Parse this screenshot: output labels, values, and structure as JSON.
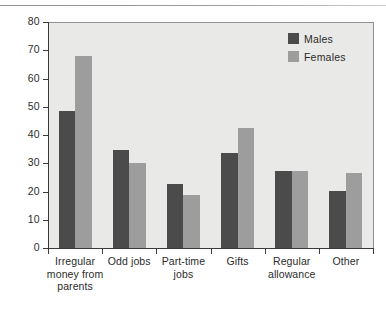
{
  "chart_data": {
    "type": "bar",
    "title": "",
    "subtitle": "",
    "xlabel": "",
    "ylabel": "",
    "ylim": [
      0,
      80
    ],
    "ytick_step": 10,
    "yticks": [
      "0",
      "10",
      "20",
      "30",
      "40",
      "50",
      "60",
      "70",
      "80"
    ],
    "grid": false,
    "legend_position": "top-right",
    "categories": [
      "Irregular money from parents",
      "Odd jobs",
      "Part-time jobs",
      "Gifts",
      "Regular allowance",
      "Other"
    ],
    "category_label_lines": [
      [
        "Irregular",
        "money from",
        "parents"
      ],
      [
        "Odd jobs"
      ],
      [
        "Part-time",
        "jobs"
      ],
      [
        "Gifts"
      ],
      [
        "Regular",
        "allowance"
      ],
      [
        "Other"
      ]
    ],
    "series": [
      {
        "name": "Males",
        "color": "#4b4b4b",
        "values": [
          49,
          35,
          23,
          34,
          27.5,
          20.5
        ]
      },
      {
        "name": "Females",
        "color": "#9d9d9d",
        "values": [
          68.5,
          30.5,
          19,
          43,
          27.5,
          27
        ]
      }
    ]
  },
  "legend": {
    "items": [
      {
        "label": "Males",
        "swatch": "males"
      },
      {
        "label": "Females",
        "swatch": "females"
      }
    ]
  },
  "colors": {
    "males": "#4b4b4b",
    "females": "#9d9d9d",
    "plot_background": "#e9e9e7",
    "axis": "#3b3b3b",
    "text": "#2b2b2b"
  }
}
